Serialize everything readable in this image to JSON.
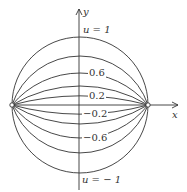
{
  "diagram": {
    "axes": {
      "x_label": "x",
      "y_label": "y"
    },
    "labels": {
      "u_top": "u = 1",
      "u_bottom": "u = − 1",
      "p06": "0.6",
      "p02": "0.2",
      "m02": "−0.2",
      "m06": "−0.6"
    },
    "foci": [
      {
        "x": 12,
        "y": 105
      },
      {
        "x": 148,
        "y": 105
      }
    ],
    "arc_sagittas_above": [
      68,
      49,
      32,
      19,
      9
    ],
    "arc_sagittas_below": [
      9,
      19,
      33,
      48,
      68
    ],
    "colors": {
      "line": "#333333",
      "background": "#ffffff"
    }
  }
}
